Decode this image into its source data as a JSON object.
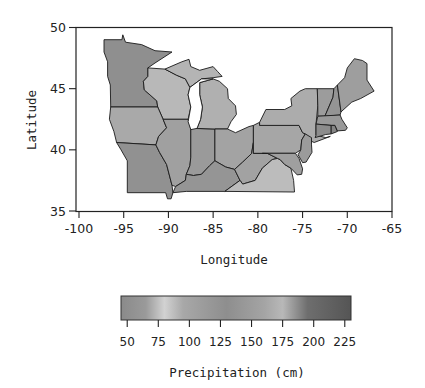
{
  "figure": {
    "xlabel": "Longitude",
    "ylabel": "Latitude",
    "colorbar_label": "Precipitation (cm)"
  },
  "axes": {
    "x_ticks": [
      "-100",
      "-95",
      "-90",
      "-85",
      "-80",
      "-75",
      "-70",
      "-65"
    ],
    "x_tick_values": [
      -100,
      -95,
      -90,
      -85,
      -80,
      -75,
      -70,
      -65
    ],
    "y_ticks": [
      "50",
      "45",
      "40",
      "35"
    ],
    "y_tick_values": [
      50,
      45,
      40,
      35
    ],
    "xlim": [
      -100,
      -65
    ],
    "ylim": [
      35,
      50
    ]
  },
  "colorbar": {
    "ticks": [
      "50",
      "75",
      "100",
      "125",
      "150",
      "175",
      "200",
      "225"
    ],
    "tick_values": [
      50,
      75,
      100,
      125,
      150,
      175,
      200,
      225
    ],
    "range": [
      45,
      230
    ],
    "stops": [
      {
        "v": 45,
        "color": "#8a8a8a"
      },
      {
        "v": 65,
        "color": "#9a9a9a"
      },
      {
        "v": 80,
        "color": "#d2d2d2"
      },
      {
        "v": 95,
        "color": "#a8a8a8"
      },
      {
        "v": 130,
        "color": "#8e8e8e"
      },
      {
        "v": 160,
        "color": "#a4a4a4"
      },
      {
        "v": 175,
        "color": "#b8b8b8"
      },
      {
        "v": 195,
        "color": "#6e6e6e"
      },
      {
        "v": 230,
        "color": "#555555"
      }
    ]
  },
  "map": {
    "region": "Midwest and Northeast United States",
    "states": [
      {
        "name": "Minnesota",
        "fill": "#8f8f8f",
        "coords": [
          [
            -97.2,
            49.0
          ],
          [
            -95.2,
            49.0
          ],
          [
            -95.1,
            49.4
          ],
          [
            -94.8,
            48.8
          ],
          [
            -93,
            48.6
          ],
          [
            -91.5,
            48.1
          ],
          [
            -89.6,
            48.0
          ],
          [
            -91.5,
            47.1
          ],
          [
            -92.3,
            46.7
          ],
          [
            -92.3,
            46.0
          ],
          [
            -92.8,
            45.6
          ],
          [
            -92.7,
            44.9
          ],
          [
            -91.3,
            44.0
          ],
          [
            -91.2,
            43.5
          ],
          [
            -96.45,
            43.5
          ],
          [
            -96.5,
            45.3
          ],
          [
            -96.8,
            46.0
          ],
          [
            -96.8,
            47.2
          ],
          [
            -97.2,
            48.0
          ]
        ]
      },
      {
        "name": "Wisconsin",
        "fill": "#b8b8b8",
        "coords": [
          [
            -92.3,
            46.7
          ],
          [
            -90.4,
            46.6
          ],
          [
            -89.1,
            46.1
          ],
          [
            -88.1,
            45.8
          ],
          [
            -87.6,
            45.1
          ],
          [
            -87.8,
            44.5
          ],
          [
            -87.5,
            43.5
          ],
          [
            -87.8,
            42.5
          ],
          [
            -90.6,
            42.5
          ],
          [
            -91.2,
            43.5
          ],
          [
            -91.3,
            44.0
          ],
          [
            -92.7,
            44.9
          ],
          [
            -92.8,
            45.6
          ],
          [
            -92.3,
            46.0
          ]
        ]
      },
      {
        "name": "Iowa",
        "fill": "#a9a9a9",
        "coords": [
          [
            -96.45,
            43.5
          ],
          [
            -91.2,
            43.5
          ],
          [
            -90.6,
            42.5
          ],
          [
            -90.2,
            41.8
          ],
          [
            -91.1,
            41.1
          ],
          [
            -91.4,
            40.4
          ],
          [
            -95.8,
            40.6
          ],
          [
            -96.1,
            41.5
          ],
          [
            -96.6,
            42.5
          ]
        ]
      },
      {
        "name": "Missouri",
        "fill": "#919191",
        "coords": [
          [
            -95.8,
            40.6
          ],
          [
            -91.4,
            40.4
          ],
          [
            -91,
            39.8
          ],
          [
            -90.2,
            38.8
          ],
          [
            -89.6,
            37.1
          ],
          [
            -89.5,
            36.5
          ],
          [
            -89.7,
            36
          ],
          [
            -90.1,
            36
          ],
          [
            -90.3,
            36.5
          ],
          [
            -94.6,
            36.5
          ],
          [
            -94.6,
            39.1
          ],
          [
            -95.3,
            40
          ]
        ]
      },
      {
        "name": "Illinois",
        "fill": "#a0a0a0",
        "coords": [
          [
            -90.6,
            42.5
          ],
          [
            -87.8,
            42.5
          ],
          [
            -87.5,
            41.7
          ],
          [
            -87.5,
            39.4
          ],
          [
            -87.6,
            38.7
          ],
          [
            -88,
            38
          ],
          [
            -88.1,
            37.5
          ],
          [
            -89.2,
            37
          ],
          [
            -89.6,
            37.1
          ],
          [
            -90.2,
            38.8
          ],
          [
            -91,
            39.8
          ],
          [
            -91.4,
            40.4
          ],
          [
            -91.1,
            41.1
          ],
          [
            -90.2,
            41.8
          ]
        ]
      },
      {
        "name": "Indiana",
        "fill": "#9a9a9a",
        "coords": [
          [
            -87.5,
            41.75
          ],
          [
            -84.8,
            41.7
          ],
          [
            -84.8,
            39.1
          ],
          [
            -85.4,
            38.7
          ],
          [
            -86.3,
            38.0
          ],
          [
            -87.2,
            37.9
          ],
          [
            -88,
            38
          ],
          [
            -87.6,
            38.7
          ],
          [
            -87.5,
            39.4
          ]
        ]
      },
      {
        "name": "Michigan-Lower",
        "fill": "#b0b0b0",
        "coords": [
          [
            -86.5,
            45.5
          ],
          [
            -85,
            45.8
          ],
          [
            -84.3,
            45.6
          ],
          [
            -83.4,
            45.0
          ],
          [
            -83.3,
            44.2
          ],
          [
            -82.5,
            43.6
          ],
          [
            -82.4,
            42.9
          ],
          [
            -83,
            42.3
          ],
          [
            -83.4,
            41.7
          ],
          [
            -84.8,
            41.7
          ],
          [
            -86.8,
            41.75
          ],
          [
            -86.4,
            42.5
          ],
          [
            -86.2,
            43.5
          ],
          [
            -86.5,
            44.5
          ]
        ]
      },
      {
        "name": "Michigan-Upper",
        "fill": "#b4b4b4",
        "coords": [
          [
            -90.4,
            46.6
          ],
          [
            -88.5,
            47.2
          ],
          [
            -87.7,
            47.4
          ],
          [
            -87.5,
            46.8
          ],
          [
            -86.5,
            46.5
          ],
          [
            -85,
            46.8
          ],
          [
            -84.5,
            46.4
          ],
          [
            -84,
            46
          ],
          [
            -85,
            45.9
          ],
          [
            -86.3,
            45.8
          ],
          [
            -87.6,
            45.1
          ],
          [
            -88.1,
            45.8
          ],
          [
            -89.1,
            46.1
          ]
        ]
      },
      {
        "name": "Ohio",
        "fill": "#a3a3a3",
        "coords": [
          [
            -84.8,
            41.7
          ],
          [
            -83.4,
            41.7
          ],
          [
            -82.5,
            41.4
          ],
          [
            -81,
            41.9
          ],
          [
            -80.5,
            42
          ],
          [
            -80.5,
            40.6
          ],
          [
            -80.7,
            39.7
          ],
          [
            -81.7,
            39
          ],
          [
            -82.6,
            38.4
          ],
          [
            -83.6,
            38.6
          ],
          [
            -84.8,
            39.1
          ]
        ]
      },
      {
        "name": "Kentucky",
        "fill": "#959595",
        "coords": [
          [
            -89.5,
            36.5
          ],
          [
            -88,
            36.6
          ],
          [
            -83.7,
            36.6
          ],
          [
            -82,
            37.5
          ],
          [
            -82.6,
            38.4
          ],
          [
            -83.6,
            38.6
          ],
          [
            -84.8,
            39.1
          ],
          [
            -85.4,
            38.7
          ],
          [
            -86.3,
            38
          ],
          [
            -87.2,
            37.9
          ],
          [
            -88,
            38
          ],
          [
            -88.1,
            37.5
          ],
          [
            -89.2,
            37
          ]
        ]
      },
      {
        "name": "West Virginia",
        "fill": "#a2a2a2",
        "coords": [
          [
            -82.6,
            38.4
          ],
          [
            -82,
            37.5
          ],
          [
            -81.7,
            37.2
          ],
          [
            -80.3,
            37.5
          ],
          [
            -79.5,
            38.5
          ],
          [
            -78.4,
            39.2
          ],
          [
            -77.8,
            39.3
          ],
          [
            -78.9,
            39.7
          ],
          [
            -80.5,
            39.7
          ],
          [
            -80.5,
            40.6
          ],
          [
            -80.7,
            39.7
          ],
          [
            -81.7,
            39
          ]
        ]
      },
      {
        "name": "Virginia",
        "fill": "#bcbcbc",
        "coords": [
          [
            -83.7,
            36.6
          ],
          [
            -75.9,
            36.55
          ],
          [
            -76,
            37.5
          ],
          [
            -76.3,
            38.5
          ],
          [
            -77,
            38.8
          ],
          [
            -77.5,
            39.2
          ],
          [
            -77.8,
            39.3
          ],
          [
            -78.4,
            39.2
          ],
          [
            -79.5,
            38.5
          ],
          [
            -80.3,
            37.5
          ],
          [
            -81.7,
            37.2
          ],
          [
            -82,
            37.5
          ]
        ]
      },
      {
        "name": "Pennsylvania",
        "fill": "#a6a6a6",
        "coords": [
          [
            -80.5,
            42
          ],
          [
            -79.8,
            42.25
          ],
          [
            -79.8,
            42
          ],
          [
            -75.4,
            42
          ],
          [
            -75,
            41.4
          ],
          [
            -74.7,
            41.3
          ],
          [
            -75.1,
            40.8
          ],
          [
            -75.2,
            40
          ],
          [
            -75.8,
            39.72
          ],
          [
            -80.5,
            39.72
          ]
        ]
      },
      {
        "name": "New York",
        "fill": "#acacac",
        "coords": [
          [
            -79.8,
            42.25
          ],
          [
            -79.1,
            43.3
          ],
          [
            -77,
            43.3
          ],
          [
            -76.2,
            43.6
          ],
          [
            -76.3,
            44.2
          ],
          [
            -75.3,
            44.8
          ],
          [
            -74.7,
            45
          ],
          [
            -73.35,
            45
          ],
          [
            -73.3,
            43.6
          ],
          [
            -73.5,
            42.1
          ],
          [
            -73.5,
            41.2
          ],
          [
            -72.4,
            41
          ],
          [
            -71.9,
            41.1
          ],
          [
            -73.7,
            40.6
          ],
          [
            -74,
            40.7
          ],
          [
            -74.7,
            41.3
          ],
          [
            -75,
            41.4
          ],
          [
            -75.4,
            42
          ],
          [
            -79.8,
            42
          ]
        ]
      },
      {
        "name": "Vermont",
        "fill": "#9c9c9c",
        "coords": [
          [
            -73.35,
            45
          ],
          [
            -71.5,
            45
          ],
          [
            -71.6,
            44.3
          ],
          [
            -72.5,
            42.75
          ],
          [
            -73.3,
            42.75
          ],
          [
            -73.3,
            43.6
          ]
        ]
      },
      {
        "name": "New Hampshire",
        "fill": "#949494",
        "coords": [
          [
            -71.5,
            45
          ],
          [
            -71.1,
            45.3
          ],
          [
            -70.7,
            43.1
          ],
          [
            -70.8,
            42.85
          ],
          [
            -72.5,
            42.75
          ],
          [
            -71.6,
            44.3
          ]
        ]
      },
      {
        "name": "Maine",
        "fill": "#9e9e9e",
        "coords": [
          [
            -71.1,
            45.3
          ],
          [
            -70.3,
            45.9
          ],
          [
            -70,
            46.7
          ],
          [
            -69.2,
            47.45
          ],
          [
            -68.3,
            47.3
          ],
          [
            -67.8,
            47.05
          ],
          [
            -67.8,
            45.7
          ],
          [
            -67,
            44.8
          ],
          [
            -68.5,
            44.2
          ],
          [
            -69.5,
            43.9
          ],
          [
            -70.7,
            43.1
          ]
        ]
      },
      {
        "name": "Massachusetts",
        "fill": "#999999",
        "coords": [
          [
            -73.5,
            42.1
          ],
          [
            -73.3,
            42.75
          ],
          [
            -70.8,
            42.85
          ],
          [
            -70.6,
            42.5
          ],
          [
            -70,
            41.8
          ],
          [
            -70.2,
            41.6
          ],
          [
            -71.1,
            41.55
          ],
          [
            -71.4,
            42.0
          ],
          [
            -71.8,
            42.0
          ]
        ]
      },
      {
        "name": "Connecticut",
        "fill": "#8c8c8c",
        "coords": [
          [
            -73.5,
            42.1
          ],
          [
            -71.8,
            42.0
          ],
          [
            -71.8,
            41.3
          ],
          [
            -72.4,
            41.25
          ],
          [
            -73.6,
            41.0
          ],
          [
            -73.5,
            41.2
          ]
        ]
      },
      {
        "name": "Rhode Island",
        "fill": "#858585",
        "coords": [
          [
            -71.8,
            42.0
          ],
          [
            -71.4,
            42.0
          ],
          [
            -71.1,
            41.5
          ],
          [
            -71.8,
            41.3
          ]
        ]
      },
      {
        "name": "New Jersey",
        "fill": "#9b9b9b",
        "coords": [
          [
            -74.7,
            41.3
          ],
          [
            -74,
            41
          ],
          [
            -74,
            40.4
          ],
          [
            -73.95,
            39.8
          ],
          [
            -74.6,
            39
          ],
          [
            -75,
            38.95
          ],
          [
            -75.5,
            39.6
          ],
          [
            -75.2,
            40
          ],
          [
            -75.1,
            40.8
          ]
        ]
      },
      {
        "name": "Maryland-Delaware",
        "fill": "#9f9f9f",
        "coords": [
          [
            -79.5,
            39.72
          ],
          [
            -75.8,
            39.72
          ],
          [
            -75.4,
            39.3
          ],
          [
            -75,
            38.45
          ],
          [
            -75.1,
            38.0
          ],
          [
            -75.6,
            37.95
          ],
          [
            -76.3,
            38.5
          ],
          [
            -77,
            38.8
          ],
          [
            -77.5,
            39.2
          ],
          [
            -77.8,
            39.3
          ],
          [
            -78.9,
            39.7
          ]
        ]
      }
    ],
    "lakes": [
      {
        "name": "Lake Michigan",
        "coords": [
          [
            -87.8,
            42.3
          ],
          [
            -87.5,
            41.65
          ],
          [
            -86.8,
            41.75
          ],
          [
            -86.4,
            42.5
          ],
          [
            -86.2,
            43.5
          ],
          [
            -86.5,
            44.5
          ],
          [
            -86.5,
            45.5
          ],
          [
            -85,
            45.8
          ],
          [
            -86.3,
            45.8
          ],
          [
            -87.6,
            45.1
          ],
          [
            -87.8,
            44.5
          ],
          [
            -87.5,
            43.5
          ]
        ]
      }
    ]
  }
}
